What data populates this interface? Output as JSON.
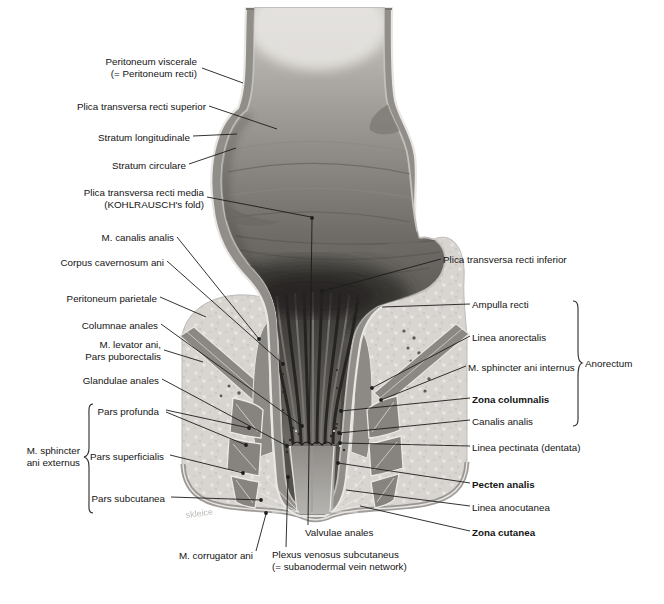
{
  "figure": {
    "type": "anatomical-diagram",
    "watermark": "skleice",
    "colors": {
      "background": "#ffffff",
      "ink": "#1c1c1c",
      "wall_gray": "#918e8a",
      "lumen_dark": "#4a4743",
      "fat_light": "#d8d5d1",
      "muscle_gray": "#87847f",
      "pecten_gray": "#b6b4b0"
    }
  },
  "labels": {
    "left": [
      {
        "id": "peritoneum-viscerale",
        "line1": "Peritoneum viscerale",
        "line2": "(= Peritoneum recti)"
      },
      {
        "id": "plica-transversa-recti-superior",
        "line1": "Plica transversa recti superior"
      },
      {
        "id": "stratum-longitudinale",
        "line1": "Stratum longitudinale"
      },
      {
        "id": "stratum-circulare",
        "line1": "Stratum circulare"
      },
      {
        "id": "plica-transversa-recti-media",
        "line1": "Plica transversa recti media",
        "line2": "(KOHLRAUSCH's fold)"
      },
      {
        "id": "m-canalis-analis",
        "line1": "M. canalis analis"
      },
      {
        "id": "corpus-cavernosum-ani",
        "line1": "Corpus cavernosum ani"
      },
      {
        "id": "peritoneum-parietale",
        "line1": "Peritoneum parietale"
      },
      {
        "id": "columnae-anales",
        "line1": "Columnae anales"
      },
      {
        "id": "m-levator-ani",
        "line1": "M. levator ani,",
        "line2": "Pars puborectalis"
      },
      {
        "id": "glandulae-anales",
        "line1": "Glandulae anales"
      },
      {
        "id": "pars-profunda",
        "line1": "Pars profunda"
      },
      {
        "id": "pars-superficialis",
        "line1": "Pars superficialis"
      },
      {
        "id": "pars-subcutanea",
        "line1": "Pars subcutanea"
      }
    ],
    "left_group": {
      "id": "m-sphincter-ani-externus",
      "line1": "M. sphincter",
      "line2": "ani externus"
    },
    "bottom": [
      {
        "id": "m-corrugator-ani",
        "line1": "M. corrugator ani"
      },
      {
        "id": "valvulae-anales",
        "line1": "Valvulae anales"
      },
      {
        "id": "plexus-venosus-subcutaneus",
        "line1": "Plexus venosus subcutaneus",
        "line2": "(= subanodermal vein network)"
      }
    ],
    "right": [
      {
        "id": "plica-transversa-recti-inferior",
        "line1": "Plica transversa recti inferior"
      },
      {
        "id": "ampulla-recti",
        "line1": "Ampulla recti"
      },
      {
        "id": "linea-anorectalis",
        "line1": "Linea anorectalis"
      },
      {
        "id": "m-sphincter-ani-internus",
        "line1": "M. sphincter ani internus"
      },
      {
        "id": "zona-columnalis",
        "line1": "Zona columnalis"
      },
      {
        "id": "canalis-analis",
        "line1": "Canalis analis"
      },
      {
        "id": "linea-pectinata",
        "line1": "Linea pectinata (dentata)"
      },
      {
        "id": "pecten-analis",
        "line1": "Pecten analis"
      },
      {
        "id": "linea-anocutanea",
        "line1": "Linea anocutanea"
      },
      {
        "id": "zona-cutanea",
        "line1": "Zona cutanea"
      }
    ],
    "right_group": {
      "id": "anorectum",
      "line1": "Anorectum"
    }
  }
}
